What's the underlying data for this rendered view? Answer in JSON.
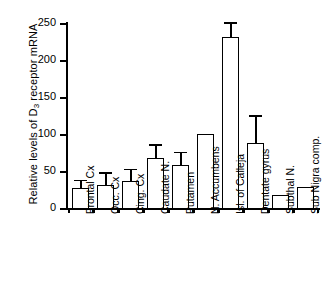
{
  "chart_data": {
    "type": "bar",
    "title": "",
    "xlabel": "",
    "ylabel": "Relative levels of D3 receptor mRNA",
    "ylabel_parts": {
      "prefix": "Relative levels of D",
      "sub": "3",
      "suffix": " receptor mRNA"
    },
    "ylim": [
      0,
      250
    ],
    "yticks": [
      0,
      50,
      100,
      150,
      200,
      250
    ],
    "ytick_labels": [
      "0",
      "50",
      "100",
      "150",
      "200",
      "250"
    ],
    "grid": false,
    "legend": null,
    "bar_color": "#ffffff",
    "edge_color": "#000000",
    "categories": [
      "Frontal Cx",
      "Occ. Cx",
      "Cing. Cx",
      "Caudate N.",
      "Putamen",
      "N. Accumbens",
      "Isl. of Calleja",
      "Dentate gyrus",
      "Subthal N.",
      "Sub Nigra comp."
    ],
    "values": [
      27,
      31,
      37,
      68,
      58,
      100,
      231,
      88,
      18,
      29
    ],
    "errors_upper": [
      36,
      46,
      51,
      84,
      74,
      null,
      249,
      123,
      null,
      null
    ],
    "error_bars": [
      9,
      15,
      14,
      16,
      16,
      0,
      18,
      35,
      0,
      0
    ]
  }
}
